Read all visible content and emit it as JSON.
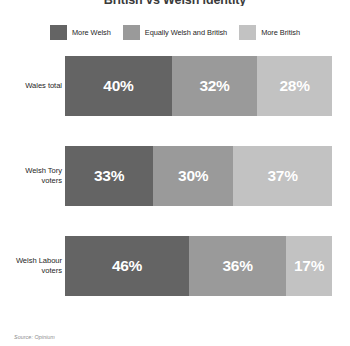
{
  "chart_data": {
    "type": "bar",
    "subtype": "stacked-horizontal-100",
    "title": "British vs Welsh identity",
    "categories": [
      "Wales total",
      "Welsh Tory voters",
      "Welsh Labour voters"
    ],
    "series": [
      {
        "name": "More Welsh",
        "color": "#646464",
        "values": [
          40,
          33,
          46
        ]
      },
      {
        "name": "Equally Welsh and British",
        "color": "#9a9a9a",
        "values": [
          32,
          30,
          36
        ]
      },
      {
        "name": "More British",
        "color": "#c2c2c2",
        "values": [
          28,
          37,
          17
        ]
      }
    ],
    "value_labels": [
      [
        "40%",
        "32%",
        "28%"
      ],
      [
        "33%",
        "30%",
        "37%"
      ],
      [
        "46%",
        "36%",
        "17%"
      ]
    ],
    "xlabel": "",
    "ylabel": "",
    "xlim": [
      0,
      100
    ],
    "grid": false,
    "legend_position": "top",
    "source": "Source: Opinium"
  },
  "legend": {
    "items": [
      {
        "label": "More Welsh",
        "color": "#646464"
      },
      {
        "label": "Equally Welsh and British",
        "color": "#9a9a9a"
      },
      {
        "label": "More British",
        "color": "#c2c2c2"
      }
    ]
  },
  "rows": [
    {
      "label": "Wales total",
      "segments": [
        {
          "value": "40%",
          "pct": 40,
          "color": "#646464"
        },
        {
          "value": "32%",
          "pct": 32,
          "color": "#9a9a9a"
        },
        {
          "value": "28%",
          "pct": 28,
          "color": "#c2c2c2"
        }
      ]
    },
    {
      "label": "Welsh Tory voters",
      "segments": [
        {
          "value": "33%",
          "pct": 33,
          "color": "#646464"
        },
        {
          "value": "30%",
          "pct": 30,
          "color": "#9a9a9a"
        },
        {
          "value": "37%",
          "pct": 37,
          "color": "#c2c2c2"
        }
      ]
    },
    {
      "label": "Welsh Labour voters",
      "segments": [
        {
          "value": "46%",
          "pct": 46,
          "color": "#646464"
        },
        {
          "value": "36%",
          "pct": 36,
          "color": "#9a9a9a"
        },
        {
          "value": "17%",
          "pct": 17,
          "color": "#c2c2c2"
        }
      ]
    }
  ],
  "footer": {
    "source": "Source: Opinium"
  },
  "title": "British vs Welsh identity"
}
